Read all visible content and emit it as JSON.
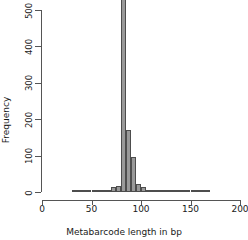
{
  "chart_data": {
    "type": "bar",
    "title": "",
    "subtitle": "",
    "xlabel": "Metabarcode length in bp",
    "ylabel": "Frequency",
    "xlim": [
      0,
      200
    ],
    "ylim": [
      0,
      530
    ],
    "xticks": [
      0,
      50,
      100,
      150,
      200
    ],
    "yticks": [
      0,
      100,
      200,
      300,
      400,
      500
    ],
    "xtick_labels": [
      "0",
      "50",
      "100",
      "150",
      "200"
    ],
    "ytick_labels": [
      "0",
      "100",
      "200",
      "300",
      "400",
      "500"
    ],
    "grid": false,
    "legend": null,
    "bin_width": 5,
    "note": "Histogram; tallest bar is clipped at the top of the plotting region",
    "bar_fill_color": "#999999",
    "bar_edge_color": "#4d4d4d",
    "axis_color": "#555555",
    "bins": [
      {
        "x_start": 30,
        "x_end": 35,
        "value": 3
      },
      {
        "x_start": 35,
        "x_end": 40,
        "value": 1
      },
      {
        "x_start": 40,
        "x_end": 45,
        "value": 1
      },
      {
        "x_start": 45,
        "x_end": 50,
        "value": 1
      },
      {
        "x_start": 50,
        "x_end": 55,
        "value": 1
      },
      {
        "x_start": 55,
        "x_end": 60,
        "value": 1
      },
      {
        "x_start": 60,
        "x_end": 65,
        "value": 1
      },
      {
        "x_start": 65,
        "x_end": 70,
        "value": 2
      },
      {
        "x_start": 70,
        "x_end": 75,
        "value": 14
      },
      {
        "x_start": 75,
        "x_end": 80,
        "value": 16
      },
      {
        "x_start": 80,
        "x_end": 85,
        "value": 530
      },
      {
        "x_start": 85,
        "x_end": 90,
        "value": 170
      },
      {
        "x_start": 90,
        "x_end": 95,
        "value": 95
      },
      {
        "x_start": 95,
        "x_end": 100,
        "value": 22
      },
      {
        "x_start": 100,
        "x_end": 105,
        "value": 13
      },
      {
        "x_start": 105,
        "x_end": 110,
        "value": 4
      },
      {
        "x_start": 110,
        "x_end": 115,
        "value": 2
      },
      {
        "x_start": 115,
        "x_end": 120,
        "value": 1
      },
      {
        "x_start": 120,
        "x_end": 125,
        "value": 1
      },
      {
        "x_start": 125,
        "x_end": 130,
        "value": 1
      },
      {
        "x_start": 130,
        "x_end": 135,
        "value": 1
      },
      {
        "x_start": 135,
        "x_end": 140,
        "value": 1
      },
      {
        "x_start": 140,
        "x_end": 145,
        "value": 1
      },
      {
        "x_start": 145,
        "x_end": 150,
        "value": 1
      },
      {
        "x_start": 150,
        "x_end": 155,
        "value": 1
      },
      {
        "x_start": 155,
        "x_end": 160,
        "value": 1
      },
      {
        "x_start": 160,
        "x_end": 165,
        "value": 1
      },
      {
        "x_start": 165,
        "x_end": 170,
        "value": 2
      }
    ]
  }
}
